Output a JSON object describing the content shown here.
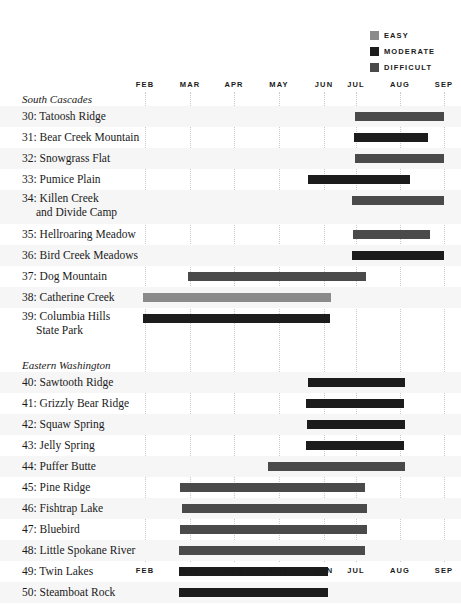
{
  "legend": {
    "items": [
      {
        "label": "EASY",
        "color": "#8a8a8a"
      },
      {
        "label": "MODERATE",
        "color": "#1c1c1c"
      },
      {
        "label": "DIFFICULT",
        "color": "#4a4a4a"
      }
    ]
  },
  "chart_data": {
    "type": "bar",
    "orientation": "horizontal",
    "subtype": "gantt-season-range",
    "title": "",
    "xlabel": "",
    "ylabel": "",
    "grid": true,
    "legend_position": "top-right",
    "axis_months": [
      "FEB",
      "MAR",
      "APR",
      "MAY",
      "JUN",
      "JUL",
      "AUG",
      "SEP"
    ],
    "axis_positions_px": [
      145,
      190,
      234,
      279,
      324,
      356,
      400,
      444
    ],
    "xlim_months": [
      "FEB",
      "SEP"
    ],
    "difficulty_levels": [
      "EASY",
      "MODERATE",
      "DIFFICULT"
    ],
    "sections": [
      {
        "name": "South Cascades",
        "rows": [
          {
            "number": "30",
            "name": "Tatoosh Ridge",
            "label": "30: Tatoosh Ridge",
            "difficulty": "DIFFICULT",
            "color": "#4a4a4a",
            "start_px": 355,
            "end_px": 444
          },
          {
            "number": "31",
            "name": "Bear Creek Mountain",
            "label": "31: Bear Creek Mountain",
            "difficulty": "MODERATE",
            "color": "#1c1c1c",
            "start_px": 354,
            "end_px": 428
          },
          {
            "number": "32",
            "name": "Snowgrass Flat",
            "label": "32: Snowgrass Flat",
            "difficulty": "DIFFICULT",
            "color": "#4a4a4a",
            "start_px": 355,
            "end_px": 444
          },
          {
            "number": "33",
            "name": "Pumice Plain",
            "label": "33: Pumice Plain",
            "difficulty": "MODERATE",
            "color": "#1c1c1c",
            "start_px": 308,
            "end_px": 410
          },
          {
            "number": "34",
            "name": "Killen Creek and Divide Camp",
            "label": "34: Killen Creek",
            "label2": "and Divide Camp",
            "difficulty": "DIFFICULT",
            "color": "#4a4a4a",
            "start_px": 352,
            "end_px": 444
          },
          {
            "number": "35",
            "name": "Hellroaring Meadow",
            "label": "35: Hellroaring Meadow",
            "difficulty": "DIFFICULT",
            "color": "#4a4a4a",
            "start_px": 353,
            "end_px": 430
          },
          {
            "number": "36",
            "name": "Bird Creek Meadows",
            "label": "36: Bird Creek Meadows",
            "difficulty": "MODERATE",
            "color": "#1c1c1c",
            "start_px": 352,
            "end_px": 444
          },
          {
            "number": "37",
            "name": "Dog Mountain",
            "label": "37: Dog Mountain",
            "difficulty": "DIFFICULT",
            "color": "#4a4a4a",
            "start_px": 188,
            "end_px": 366
          },
          {
            "number": "38",
            "name": "Catherine Creek",
            "label": "38: Catherine Creek",
            "difficulty": "EASY",
            "color": "#8a8a8a",
            "start_px": 143,
            "end_px": 331
          },
          {
            "number": "39",
            "name": "Columbia Hills State Park",
            "label": "39: Columbia Hills",
            "label2": "State Park",
            "difficulty": "MODERATE",
            "color": "#1c1c1c",
            "start_px": 143,
            "end_px": 330
          }
        ]
      },
      {
        "name": "Eastern Washington",
        "rows": [
          {
            "number": "40",
            "name": "Sawtooth Ridge",
            "label": "40: Sawtooth Ridge",
            "difficulty": "MODERATE",
            "color": "#1c1c1c",
            "start_px": 308,
            "end_px": 405
          },
          {
            "number": "41",
            "name": "Grizzly Bear Ridge",
            "label": "41: Grizzly Bear Ridge",
            "difficulty": "MODERATE",
            "color": "#1c1c1c",
            "start_px": 306,
            "end_px": 404
          },
          {
            "number": "42",
            "name": "Squaw Spring",
            "label": "42: Squaw Spring",
            "difficulty": "MODERATE",
            "color": "#1c1c1c",
            "start_px": 307,
            "end_px": 405
          },
          {
            "number": "43",
            "name": "Jelly Spring",
            "label": "43: Jelly Spring",
            "difficulty": "MODERATE",
            "color": "#1c1c1c",
            "start_px": 306,
            "end_px": 404
          },
          {
            "number": "44",
            "name": "Puffer Butte",
            "label": "44: Puffer Butte",
            "difficulty": "DIFFICULT",
            "color": "#4a4a4a",
            "start_px": 268,
            "end_px": 405
          },
          {
            "number": "45",
            "name": "Pine Ridge",
            "label": "45: Pine Ridge",
            "difficulty": "DIFFICULT",
            "color": "#4a4a4a",
            "start_px": 180,
            "end_px": 365
          },
          {
            "number": "46",
            "name": "Fishtrap Lake",
            "label": "46: Fishtrap Lake",
            "difficulty": "DIFFICULT",
            "color": "#4a4a4a",
            "start_px": 182,
            "end_px": 367
          },
          {
            "number": "47",
            "name": "Bluebird",
            "label": "47: Bluebird",
            "difficulty": "DIFFICULT",
            "color": "#4a4a4a",
            "start_px": 180,
            "end_px": 367
          },
          {
            "number": "48",
            "name": "Little Spokane River",
            "label": "48: Little Spokane River",
            "difficulty": "DIFFICULT",
            "color": "#4a4a4a",
            "start_px": 179,
            "end_px": 365
          },
          {
            "number": "49",
            "name": "Twin Lakes",
            "label": "49: Twin Lakes",
            "difficulty": "MODERATE",
            "color": "#1c1c1c",
            "start_px": 179,
            "end_px": 328
          },
          {
            "number": "50",
            "name": "Steamboat Rock",
            "label": "50: Steamboat Rock",
            "difficulty": "MODERATE",
            "color": "#1c1c1c",
            "start_px": 179,
            "end_px": 328
          }
        ]
      }
    ]
  }
}
